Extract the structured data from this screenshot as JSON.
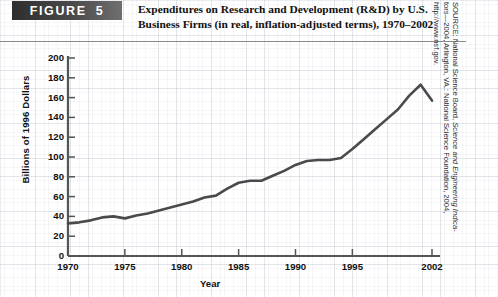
{
  "figure": {
    "badge_word": "FIGURE",
    "badge_number": "5",
    "title_line1": "Expenditures on Research and Development (R&D) by U.S.",
    "title_line2": "Business Firms (in real, inflation-adjusted terms), 1970–2002"
  },
  "source": {
    "prefix": "SOURCE: National Science Board, ",
    "italic": "Science and Engineering Indica-",
    "middle": "tors—2004, Arlington, VA.: National Science Foundation, 2004,",
    "url": "http://www.nsf.gov."
  },
  "colors": {
    "line": "#4a4a4a",
    "axis": "#555555",
    "text": "#111111",
    "badge_dark": "#2e2e2e",
    "badge_light": "#6f6f6f",
    "grid": "#96a0af"
  },
  "chart_data": {
    "type": "line",
    "title": "Expenditures on Research and Development (R&D) by U.S. Business Firms (in real, inflation-adjusted terms), 1970–2002",
    "xlabel": "Year",
    "ylabel": "Billions of 1996 Dollars",
    "xlim": [
      1970,
      2002
    ],
    "ylim": [
      0,
      200
    ],
    "ytick_values": [
      0,
      20,
      40,
      60,
      80,
      100,
      120,
      140,
      160,
      180,
      200
    ],
    "ytick_labels": [
      "0",
      "20",
      "40",
      "60",
      "80",
      "100",
      "120",
      "140",
      "160",
      "180",
      "200"
    ],
    "xtick_values": [
      1970,
      1975,
      1980,
      1985,
      1990,
      1995,
      2002
    ],
    "xtick_labels": [
      "1970",
      "1975",
      "1980",
      "1985",
      "1990",
      "1995",
      "2002"
    ],
    "grid": true,
    "legend": null,
    "series": [
      {
        "name": "R&D expenditures by U.S. business firms",
        "x": [
          1970,
          1971,
          1972,
          1973,
          1974,
          1975,
          1976,
          1977,
          1978,
          1979,
          1980,
          1981,
          1982,
          1983,
          1984,
          1985,
          1986,
          1987,
          1988,
          1989,
          1990,
          1991,
          1992,
          1993,
          1994,
          1995,
          1996,
          1997,
          1998,
          1999,
          2000,
          2001,
          2002
        ],
        "values": [
          33,
          34,
          36,
          39,
          40,
          38,
          41,
          43,
          46,
          49,
          52,
          55,
          59,
          61,
          68,
          74,
          76,
          76,
          81,
          86,
          92,
          96,
          97,
          97,
          99,
          108,
          118,
          128,
          138,
          148,
          162,
          173,
          157
        ]
      }
    ]
  }
}
